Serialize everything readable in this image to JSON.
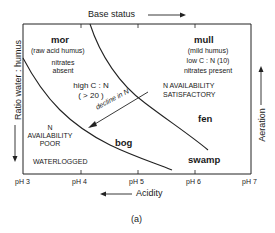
{
  "axes": {
    "top_label": "Base status",
    "bottom_label": "Acidity",
    "left_label": "Ratio water : humus",
    "right_label": "Aeration",
    "x_ticks": [
      "pH 3",
      "pH 4",
      "pH 5",
      "pH 6",
      "pH 7"
    ]
  },
  "regions": {
    "mor": {
      "title": "mor",
      "line1": "(raw acid humus)",
      "line2": "nitrates",
      "line3": "absent"
    },
    "high_cn": {
      "line1": "high C : N",
      "line2": "( > 20 )"
    },
    "mull": {
      "title": "mull",
      "line1": "(mild humus)",
      "line2": "low C : N (10)",
      "line3": "nitrates present"
    },
    "n_satisfactory": {
      "line1": "N AVAILABILITY",
      "line2": "SATISFACTORY"
    },
    "decline": {
      "label": "decline in N"
    },
    "fen": {
      "title": "fen"
    },
    "bog": {
      "title": "bog"
    },
    "swamp": {
      "title": "swamp"
    },
    "n_poor": {
      "line1": "N",
      "line2": "AVAILABILITY",
      "line3": "POOR"
    },
    "waterlogged": {
      "label": "WATERLOGGED"
    }
  },
  "caption": "(a)"
}
